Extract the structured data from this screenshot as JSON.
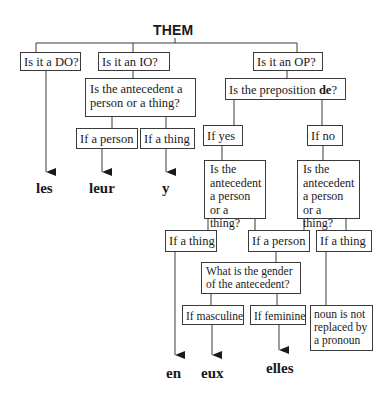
{
  "diagram": {
    "title": "THEM",
    "questions": {
      "do": "Is it a DO?",
      "io": "Is it an IO?",
      "op": "Is it an OP?",
      "io_antecedent": "Is the antecedent a person or a thing?",
      "preposition_prefix": "Is the preposition ",
      "preposition_bold": "de",
      "preposition_suffix": "?",
      "yes_antecedent": "Is the antecedent a person or a thing?",
      "no_antecedent": "Is the antecedent a person or a thing?",
      "gender": "What is the gender of the antecedent?"
    },
    "branches": {
      "io_person": "If a person",
      "io_thing": "If a thing",
      "yes": "If yes",
      "no": "If no",
      "yes_thing": "If a thing",
      "person_merged": "If a person",
      "no_thing": "If a thing",
      "masculine": "If masculine",
      "feminine": "If feminine"
    },
    "outcomes": {
      "no_replacement": "noun is not replaced by a pronoun"
    },
    "answers": {
      "do": "les",
      "io_person": "leur",
      "io_thing": "y",
      "de_thing": "en",
      "masculine": "eux",
      "feminine": "elles"
    }
  }
}
